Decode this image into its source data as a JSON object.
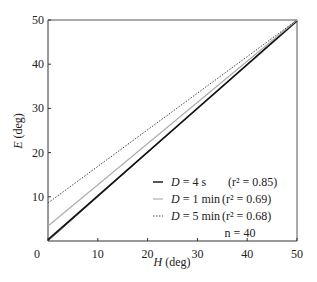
{
  "chart_data": {
    "type": "line",
    "title": "",
    "xlabel": "H (deg)",
    "xlabel_var": "H",
    "xlabel_unit": " (deg)",
    "ylabel": "E (deg)",
    "ylabel_var": "E",
    "ylabel_unit": " (deg)",
    "xlim": [
      0,
      50
    ],
    "ylim": [
      0,
      50
    ],
    "xticks": [
      0,
      10,
      20,
      30,
      40,
      50
    ],
    "yticks": [
      10,
      20,
      30,
      40,
      50
    ],
    "grid": false,
    "legend_position": "bottom-right",
    "series": [
      {
        "name": "identity",
        "x": [
          0,
          50
        ],
        "y": [
          0,
          50
        ],
        "style": "thin-solid",
        "color": "#333333"
      },
      {
        "name": "D = 4 s",
        "label_var": "D",
        "label_val": " = 4 s",
        "r2": "(r² = 0.85)",
        "x": [
          0,
          50
        ],
        "y": [
          0.3,
          49.8
        ],
        "style": "solid",
        "color": "#111111"
      },
      {
        "name": "D = 1 min",
        "label_var": "D",
        "label_val": " = 1 min",
        "r2": "(r² = 0.69)",
        "x": [
          0,
          50
        ],
        "y": [
          3.4,
          50
        ],
        "style": "solid",
        "color": "#aaaaaa"
      },
      {
        "name": "D = 5 min",
        "label_var": "D",
        "label_val": " = 5 min",
        "r2": "(r² = 0.68)",
        "x": [
          0,
          50
        ],
        "y": [
          8.6,
          50
        ],
        "style": "dotted",
        "color": "#444444"
      }
    ],
    "annotation": "n = 40"
  }
}
